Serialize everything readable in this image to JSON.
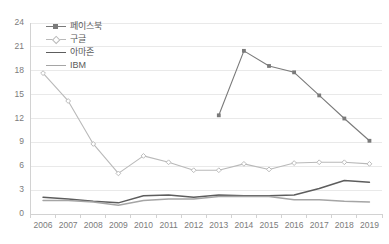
{
  "chart_data": {
    "type": "line",
    "title": "",
    "xlabel": "",
    "ylabel": "",
    "categories": [
      "2006",
      "2007",
      "2008",
      "2009",
      "2010",
      "2011",
      "2012",
      "2013",
      "2014",
      "2015",
      "2016",
      "2017",
      "2018",
      "2019"
    ],
    "x_ticks": [
      "2006",
      "2007",
      "2008",
      "2009",
      "2010",
      "2011",
      "2012",
      "2013",
      "2014",
      "2015",
      "2016",
      "2017",
      "2018",
      "2019"
    ],
    "y_ticks": [
      "0",
      "3",
      "6",
      "9",
      "12",
      "15",
      "18",
      "21",
      "24"
    ],
    "ylim": [
      0,
      24
    ],
    "grid": true,
    "grid_axis": "y",
    "legend_position": "upper-left",
    "series": [
      {
        "name": "페이스북",
        "color": "#7a7a7a",
        "marker": "square",
        "values": [
          null,
          null,
          null,
          null,
          null,
          null,
          null,
          12.4,
          20.5,
          18.6,
          17.8,
          14.9,
          12.0,
          9.2
        ]
      },
      {
        "name": "구글",
        "color": "#b9b9b9",
        "marker": "diamond",
        "values": [
          17.7,
          14.2,
          8.8,
          5.1,
          7.3,
          6.5,
          5.5,
          5.5,
          6.3,
          5.6,
          6.4,
          6.5,
          6.5,
          6.3
        ]
      },
      {
        "name": "아마존",
        "color": "#5d5d5d",
        "marker": "none",
        "values": [
          2.1,
          1.9,
          1.6,
          1.4,
          2.3,
          2.4,
          2.1,
          2.4,
          2.3,
          2.3,
          2.4,
          3.2,
          4.2,
          4.0
        ]
      },
      {
        "name": "IBM",
        "color": "#a5a5a5",
        "marker": "none",
        "values": [
          1.7,
          1.7,
          1.5,
          1.1,
          1.7,
          1.9,
          1.9,
          2.2,
          2.2,
          2.2,
          1.8,
          1.8,
          1.6,
          1.5
        ]
      }
    ]
  },
  "legend": {
    "items": [
      {
        "label": "페이스북"
      },
      {
        "label": "구글"
      },
      {
        "label": "아마존"
      },
      {
        "label": "IBM"
      }
    ]
  },
  "colors": {
    "facebook": "#7a7a7a",
    "google": "#b9b9b9",
    "amazon": "#5d5d5d",
    "ibm": "#a5a5a5",
    "grid": "#e9e9e9",
    "axis": "#d2d2d2",
    "tick_text": "#7b7b7b"
  }
}
